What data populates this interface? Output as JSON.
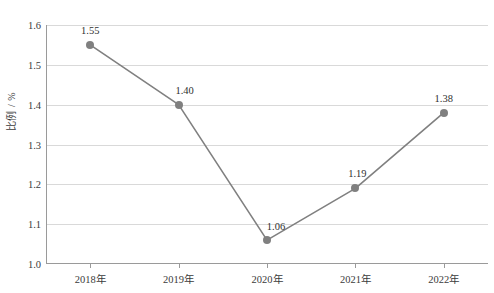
{
  "chart_data": {
    "type": "line",
    "title": "",
    "xlabel": "",
    "ylabel": "比例 / %",
    "categories": [
      "2018年",
      "2019年",
      "2020年",
      "2021年",
      "2022年"
    ],
    "values": [
      1.55,
      1.4,
      1.06,
      1.19,
      1.38
    ],
    "point_labels": [
      "1.55",
      "1.40",
      "1.06",
      "1.19",
      "1.38"
    ],
    "ylim": [
      1.0,
      1.6
    ],
    "ytick_step": 0.1,
    "yticks": [
      "1.0",
      "1.1",
      "1.2",
      "1.3",
      "1.4",
      "1.5",
      "1.6"
    ],
    "grid": true,
    "legend": "none",
    "series": [
      {
        "name": "比例 / %",
        "values": [
          1.55,
          1.4,
          1.06,
          1.19,
          1.38
        ]
      }
    ],
    "colors": {
      "line": "#808080",
      "marker": "#808080",
      "gridline": "#d9d9d9",
      "axis": "#9a9a9a",
      "text": "#3b3b3b",
      "background": "#ffffff"
    }
  }
}
